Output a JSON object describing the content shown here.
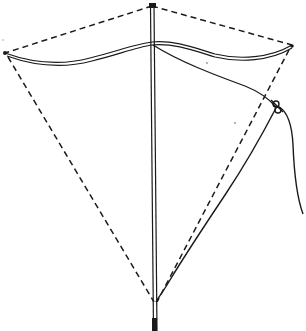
{
  "figure": {
    "colors": {
      "ink": "#1a1a1a",
      "background": "#ffffff"
    },
    "components": [
      {
        "name": "spine",
        "label": "Vertical spine stick"
      },
      {
        "name": "bow",
        "label": "Bowed cross-spar"
      },
      {
        "name": "outline",
        "label": "Dashed frame string outline"
      },
      {
        "name": "bridle",
        "label": "Bridle string"
      },
      {
        "name": "knot",
        "label": "Bridle knot / towing point"
      },
      {
        "name": "flying-line",
        "label": "Flying line"
      }
    ]
  }
}
